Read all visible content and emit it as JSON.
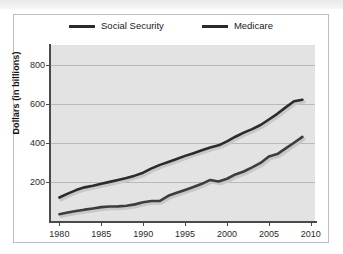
{
  "chart_data": {
    "type": "line",
    "title": "",
    "xlabel": "",
    "ylabel": "Dollars (in billions)",
    "xlim": [
      1979,
      2010.5
    ],
    "ylim": [
      0,
      900
    ],
    "xticks": [
      1980,
      1985,
      1990,
      1995,
      2000,
      2005,
      2010
    ],
    "yticks": [
      200,
      400,
      600,
      800
    ],
    "grid": true,
    "legend_position": "top-center",
    "x": [
      1980,
      1981,
      1982,
      1983,
      1984,
      1985,
      1986,
      1987,
      1988,
      1989,
      1990,
      1991,
      1992,
      1993,
      1994,
      1995,
      1996,
      1997,
      1998,
      1999,
      2000,
      2001,
      2002,
      2003,
      2004,
      2005,
      2006,
      2007,
      2008,
      2009
    ],
    "series": [
      {
        "name": "Social Security",
        "color": "#2b2b2b",
        "values": [
          120,
          140,
          158,
          172,
          180,
          190,
          200,
          210,
          220,
          232,
          247,
          269,
          287,
          302,
          317,
          333,
          347,
          362,
          376,
          387,
          407,
          431,
          452,
          470,
          491,
          519,
          548,
          581,
          612,
          620
        ]
      },
      {
        "name": "Medicare",
        "color": "#3d3d3d",
        "values": [
          35,
          43,
          51,
          58,
          64,
          71,
          74,
          75,
          78,
          85,
          96,
          102,
          103,
          129,
          144,
          159,
          174,
          190,
          210,
          202,
          216,
          238,
          253,
          274,
          297,
          330,
          342,
          371,
          400,
          430
        ]
      }
    ]
  },
  "legend": {
    "items": [
      {
        "label": "Social Security"
      },
      {
        "label": "Medicare"
      }
    ]
  },
  "axes": {
    "y_title": "Dollars (in billions)",
    "y_tick_labels": [
      "200",
      "400",
      "600",
      "800"
    ],
    "x_tick_labels": [
      "1980",
      "1985",
      "1990",
      "1995",
      "2000",
      "2005",
      "2010"
    ]
  },
  "colors": {
    "plot_background": "#e3e3e3",
    "gridline": "#b9b9b9",
    "axis": "#4a4a4a",
    "series_primary": "#2b2b2b",
    "series_secondary": "#3d3d3d",
    "shadow": "#c8c8c8",
    "frame": "#bfbfbf",
    "page_background": "#ffffff"
  }
}
